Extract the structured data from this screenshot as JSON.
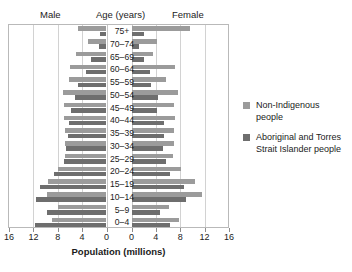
{
  "header": {
    "male_label": "Male",
    "age_label": "Age (years)",
    "female_label": "Female"
  },
  "axis": {
    "title": "Population (millions)",
    "tick_labels": [
      "16",
      "12",
      "8",
      "4",
      "0",
      "0",
      "4",
      "8",
      "12",
      "16"
    ]
  },
  "legend": {
    "items": [
      {
        "label": "Non-Indigenous people",
        "color": "#9b9b9b"
      },
      {
        "label": "Aboriginal and Torres Strait Islander people",
        "color": "#6e6e6e"
      }
    ]
  },
  "chart_data": {
    "type": "bar",
    "subtype": "population-pyramid",
    "title": "",
    "xlabel": "Population (millions)",
    "ylabel": "Age (years)",
    "xlim": [
      0,
      16
    ],
    "grid": true,
    "legend_position": "right",
    "categories": [
      "75+",
      "70–74",
      "65–69",
      "60–64",
      "55–59",
      "50–54",
      "45–49",
      "40–44",
      "35–39",
      "30–34",
      "25–29",
      "20–24",
      "15–19",
      "10–14",
      "5–9",
      "0–4"
    ],
    "sides": [
      "Male",
      "Female"
    ],
    "series": [
      {
        "name": "Non-Indigenous people",
        "color": "#9b9b9b",
        "male": [
          4.6,
          3.0,
          5.0,
          6.0,
          6.2,
          7.2,
          7.0,
          7.0,
          6.8,
          6.8,
          6.8,
          8.0,
          9.6,
          9.8,
          8.0,
          9.0
        ],
        "female": [
          9.6,
          4.2,
          3.6,
          7.2,
          5.6,
          7.6,
          7.0,
          7.2,
          7.0,
          7.0,
          6.8,
          8.2,
          10.4,
          11.6,
          6.2,
          7.8
        ]
      },
      {
        "name": "Aboriginal and Torres Strait Islander people",
        "color": "#6e6e6e",
        "male": [
          1.0,
          1.2,
          2.6,
          3.4,
          4.6,
          5.2,
          5.8,
          6.2,
          6.4,
          6.6,
          7.0,
          8.6,
          11.0,
          11.6,
          9.8,
          11.8
        ],
        "female": [
          2.0,
          1.2,
          2.0,
          3.0,
          3.2,
          4.4,
          4.2,
          5.4,
          5.4,
          5.2,
          5.6,
          6.4,
          8.6,
          9.0,
          4.6,
          6.4
        ]
      }
    ]
  }
}
